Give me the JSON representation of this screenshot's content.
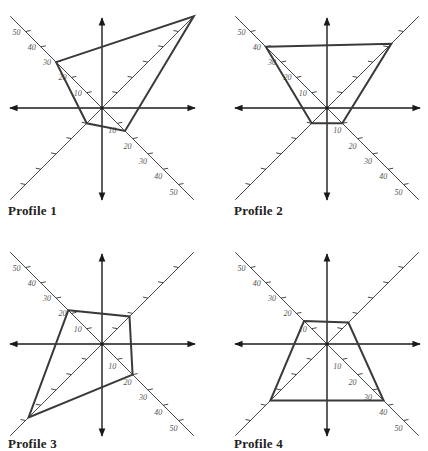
{
  "figure": {
    "scale_px_per_unit": 1.53,
    "axis_extent_units": 60,
    "tick_values": [
      10,
      20,
      30,
      40,
      50
    ],
    "colors": {
      "axis": "#1a1a1a",
      "diagonal": "#333333",
      "polygon": "#3a3a3a",
      "label": "#555555",
      "title": "#222222"
    }
  },
  "panels": [
    {
      "title": "Profile 1",
      "center": [
        102,
        108
      ],
      "title_pos": [
        8,
        218
      ]
    },
    {
      "title": "Profile 2",
      "center": [
        113,
        108
      ],
      "title_pos": [
        20,
        218
      ]
    },
    {
      "title": "Profile 3",
      "center": [
        102,
        119
      ],
      "title_pos": [
        8,
        222
      ]
    },
    {
      "title": "Profile 4",
      "center": [
        113,
        119
      ],
      "title_pos": [
        20,
        222
      ]
    }
  ],
  "chart_data": [
    {
      "type": "radar",
      "title": "Profile 1",
      "axes": [
        "NW",
        "NE",
        "SE",
        "SW"
      ],
      "values": [
        30,
        60,
        15,
        10
      ],
      "tick_labels": [
        "10",
        "20",
        "30",
        "40",
        "50"
      ],
      "labeled_axes": [
        "NW",
        "SE"
      ],
      "range": [
        0,
        60
      ]
    },
    {
      "type": "radar",
      "title": "Profile 2",
      "axes": [
        "NW",
        "NE",
        "SE",
        "SW"
      ],
      "values": [
        40,
        42,
        10,
        10
      ],
      "tick_labels": [
        "10",
        "20",
        "30",
        "40",
        "50"
      ],
      "labeled_axes": [
        "NW",
        "SE"
      ],
      "range": [
        0,
        60
      ]
    },
    {
      "type": "radar",
      "title": "Profile 3",
      "axes": [
        "NW",
        "NE",
        "SE",
        "SW"
      ],
      "values": [
        22,
        18,
        20,
        48
      ],
      "tick_labels": [
        "10",
        "20",
        "30",
        "40",
        "50"
      ],
      "labeled_axes": [
        "NW",
        "SE"
      ],
      "range": [
        0,
        60
      ]
    },
    {
      "type": "radar",
      "title": "Profile 4",
      "axes": [
        "NW",
        "NE",
        "SE",
        "SW"
      ],
      "values": [
        15,
        14,
        37,
        37
      ],
      "tick_labels": [
        "10",
        "20",
        "30",
        "40",
        "50"
      ],
      "labeled_axes": [
        "NW",
        "SE"
      ],
      "range": [
        0,
        60
      ]
    }
  ]
}
